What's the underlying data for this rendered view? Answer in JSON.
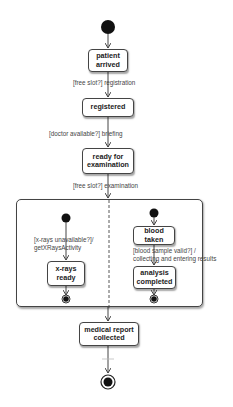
{
  "diagram": {
    "type": "UML state machine",
    "states": {
      "patient_arrived": "patient arrived",
      "registered": "registered",
      "ready_for_examination": "ready for examination",
      "xrays_ready": "x-rays ready",
      "blood_taken": "blood taken",
      "analysis_completed": "analysis completed",
      "medical_report_collected": "medical report collected"
    },
    "transitions": {
      "t_registration": "[free slot?] registration",
      "t_briefing": "[doctor available?] briefing",
      "t_examination": "[free slot?] examination",
      "t_xrays_line1": "[x-rays unavailable?]/",
      "t_xrays_line2": "getXRaysActivity",
      "t_blood_line1": "[blood sample valid?] /",
      "t_blood_line2": "collecting and entering results"
    },
    "composite_state": {
      "regions": [
        "x-rays region",
        "blood test region"
      ]
    },
    "colors": {
      "stroke": "#444444",
      "fill": "#ffffff",
      "node": "#111111",
      "text": "#222222"
    }
  }
}
